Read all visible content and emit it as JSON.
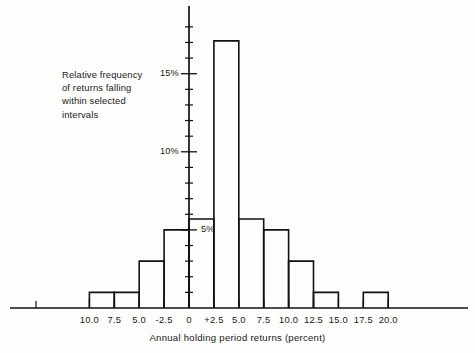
{
  "chart_data": {
    "type": "bar",
    "title": "",
    "subtitle": "",
    "xlabel": "Annual holding period returns (percent)",
    "ylabel": "Relative frequency of returns falling within selected intervals",
    "grid": false,
    "legend": "none",
    "bin_width": 2.5,
    "xlim": [
      -13.75,
      21.25
    ],
    "ylim": [
      0,
      18.5
    ],
    "x_tick_labels": [
      "10.0",
      "7.5",
      "5.0",
      "-2.5",
      "0",
      "+2.5",
      "5.0",
      "7.5",
      "10.0",
      "12.5",
      "15.0",
      "17.5",
      "20.0"
    ],
    "x_tick_values": [
      -10.0,
      -7.5,
      -5.0,
      -2.5,
      0,
      2.5,
      5.0,
      7.5,
      10.0,
      12.5,
      15.0,
      17.5,
      20.0
    ],
    "y_tick_labels": [
      "5%",
      "10%",
      "15%"
    ],
    "y_tick_values": [
      5,
      10,
      15
    ],
    "y_minor_step": 1,
    "categories": [
      "-12.5 to -10.0",
      "-10.0 to -7.5",
      "-7.5 to -5.0",
      "-5.0 to -2.5",
      "-2.5 to 0",
      "0 to +2.5",
      "+2.5 to 5.0",
      "5.0 to 7.5",
      "7.5 to 10.0",
      "10.0 to 12.5",
      "12.5 to 15.0",
      "15.0 to 17.5",
      "17.5 to 20.0"
    ],
    "bin_starts": [
      -12.5,
      -10.0,
      -7.5,
      -5.0,
      -2.5,
      0,
      2.5,
      5.0,
      7.5,
      10.0,
      12.5,
      15.0,
      17.5
    ],
    "values": [
      0,
      1.0,
      1.0,
      3.0,
      5.0,
      5.7,
      17.1,
      5.7,
      5.0,
      3.0,
      1.0,
      0,
      1.0
    ]
  },
  "annotation": {
    "line1": "Relative frequency",
    "line2": "of returns falling",
    "line3": "within selected",
    "line4": "intervals"
  },
  "axis": {
    "x_title": "Annual holding period returns (percent)",
    "y_labels": [
      "15%",
      "10%",
      "5%"
    ]
  },
  "colors": {
    "ink": "#111111",
    "background": "#fdfdfb"
  }
}
